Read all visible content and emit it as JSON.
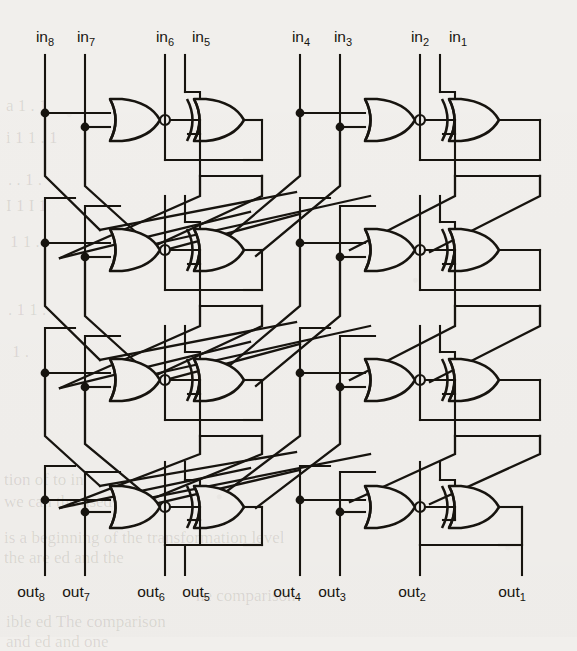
{
  "figure": {
    "kind": "logic-circuit-diagram",
    "width": 577,
    "height": 637,
    "background_color": "#f1efec",
    "ink_color": "#17140f",
    "stage_count": 4,
    "line_count": 8,
    "cells_per_stage": 4
  },
  "inputs": {
    "labels": [
      {
        "name": "in8",
        "text": "in",
        "sub": "8",
        "x": 45,
        "y": 42
      },
      {
        "name": "in7",
        "text": "in",
        "sub": "7",
        "x": 86,
        "y": 42
      },
      {
        "name": "in6",
        "text": "in",
        "sub": "6",
        "x": 165,
        "y": 42
      },
      {
        "name": "in5",
        "text": "in",
        "sub": "5",
        "x": 201,
        "y": 42
      },
      {
        "name": "in4",
        "text": "in",
        "sub": "4",
        "x": 301,
        "y": 42
      },
      {
        "name": "in3",
        "text": "in",
        "sub": "3",
        "x": 343,
        "y": 42
      },
      {
        "name": "in2",
        "text": "in",
        "sub": "2",
        "x": 420,
        "y": 42
      },
      {
        "name": "in1",
        "text": "in",
        "sub": "1",
        "x": 458,
        "y": 42
      }
    ]
  },
  "outputs": {
    "labels": [
      {
        "name": "out8",
        "text": "out",
        "sub": "8",
        "x": 31,
        "y": 597
      },
      {
        "name": "out7",
        "text": "out",
        "sub": "7",
        "x": 76,
        "y": 597
      },
      {
        "name": "out6",
        "text": "out",
        "sub": "6",
        "x": 151,
        "y": 597
      },
      {
        "name": "out5",
        "text": "out",
        "sub": "5",
        "x": 196,
        "y": 597
      },
      {
        "name": "out4",
        "text": "out",
        "sub": "4",
        "x": 287,
        "y": 597
      },
      {
        "name": "out3",
        "text": "out",
        "sub": "3",
        "x": 332,
        "y": 597
      },
      {
        "name": "out2",
        "text": "out",
        "sub": "2",
        "x": 412,
        "y": 597
      },
      {
        "name": "out1",
        "text": "out",
        "sub": "1",
        "x": 512,
        "y": 597
      }
    ]
  },
  "gates": {
    "nor": {
      "label": "NOR",
      "count": 8,
      "has_output_bubble": true
    },
    "xor": {
      "label": "XOR",
      "count": 8,
      "has_output_bubble": false
    }
  },
  "stages": [
    {
      "name": "stage-1",
      "y_center": 113
    },
    {
      "name": "stage-2",
      "y_center": 243
    },
    {
      "name": "stage-3",
      "y_center": 373
    },
    {
      "name": "stage-4",
      "y_center": 500
    }
  ],
  "ghost_text": [
    {
      "id": "g1",
      "text": "a 1 . 1",
      "x": 6,
      "y": 96
    },
    {
      "id": "g2",
      "text": "i 1 1 . 1",
      "x": 6,
      "y": 128
    },
    {
      "id": "g3",
      "text": ". . 1 .",
      "x": 8,
      "y": 170
    },
    {
      "id": "g4",
      "text": "I 1 I 1",
      "x": 6,
      "y": 196
    },
    {
      "id": "g5",
      "text": "1 1 .",
      "x": 10,
      "y": 232
    },
    {
      "id": "g6",
      "text": ". 1 1 .",
      "x": 8,
      "y": 300
    },
    {
      "id": "g7",
      "text": "1 .",
      "x": 12,
      "y": 342
    },
    {
      "id": "g8",
      "text": "tion of   to   in",
      "x": 4,
      "y": 470
    },
    {
      "id": "g9",
      "text": "we can   the   used for the",
      "x": 4,
      "y": 492
    },
    {
      "id": "g10",
      "text": "is a   beginning of the transformation level",
      "x": 4,
      "y": 528
    },
    {
      "id": "g11",
      "text": "the   are   ed and the",
      "x": 4,
      "y": 548
    },
    {
      "id": "g12",
      "text": "he comparison",
      "x": 196,
      "y": 586
    },
    {
      "id": "g13",
      "text": "ible   ed   The comparison",
      "x": 6,
      "y": 612
    },
    {
      "id": "g14",
      "text": "and   ed   and one",
      "x": 6,
      "y": 632
    }
  ]
}
